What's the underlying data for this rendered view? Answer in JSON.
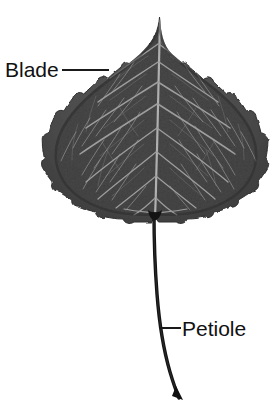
{
  "figure": {
    "kind": "botanical-diagram",
    "background_color": "#ffffff",
    "width": 275,
    "height": 406
  },
  "labels": {
    "blade": {
      "text": "Blade",
      "color": "#111111",
      "leader_icon": "leader-line-icon"
    },
    "petiole": {
      "text": "Petiole",
      "color": "#111111",
      "leader_icon": "leader-line-icon"
    }
  },
  "specimen": {
    "blade_color": "#4f4f4f",
    "blade_shadow_color": "#3a3a3a",
    "vein_color": "#9a9a9a",
    "midrib_color": "#a8a8a8",
    "petiole_color": "#131313",
    "outline_color": "#2e2e2e"
  }
}
